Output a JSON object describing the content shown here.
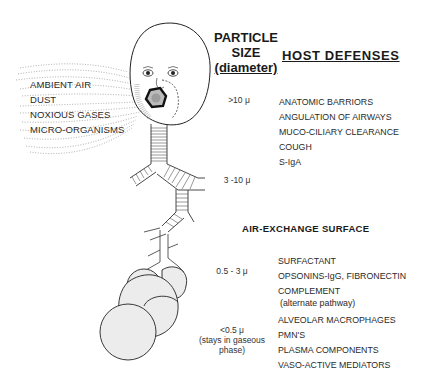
{
  "inhaled_agents": {
    "items": [
      "AMBIENT AIR",
      "DUST",
      "NOXIOUS GASES",
      "MICRO-ORGANISMS"
    ]
  },
  "particle_size": {
    "header_line1": "PARTICLE",
    "header_line2": "SIZE",
    "header_line3": "(diameter)",
    "levels": [
      {
        "label": ">10 μ"
      },
      {
        "label": "3 -10 μ"
      },
      {
        "label": "0.5 - 3 μ"
      },
      {
        "label": "<0.5 μ",
        "note_line1": "(stays in gaseous",
        "note_line2": "phase)"
      }
    ]
  },
  "host_defenses": {
    "header": "HOST  DEFENSES",
    "upper": [
      "ANATOMIC BARRIORS",
      "ANGULATION OF AIRWAYS",
      "MUCO-CILIARY CLEARANCE",
      "COUGH",
      "S-IgA"
    ],
    "air_exchange_header": "AIR-EXCHANGE  SURFACE",
    "lower": [
      {
        "label": "SURFACTANT"
      },
      {
        "label": "OPSONINS-IgG, FIBRONECTIN"
      },
      {
        "label": "COMPLEMENT",
        "note": "(alternate pathway)"
      },
      {
        "label": "ALVEOLAR MACROPHAGES"
      },
      {
        "label": "PMN'S"
      },
      {
        "label": "PLASMA COMPONENTS"
      },
      {
        "label": "VASO-ACTIVE MEDIATORS"
      }
    ]
  }
}
